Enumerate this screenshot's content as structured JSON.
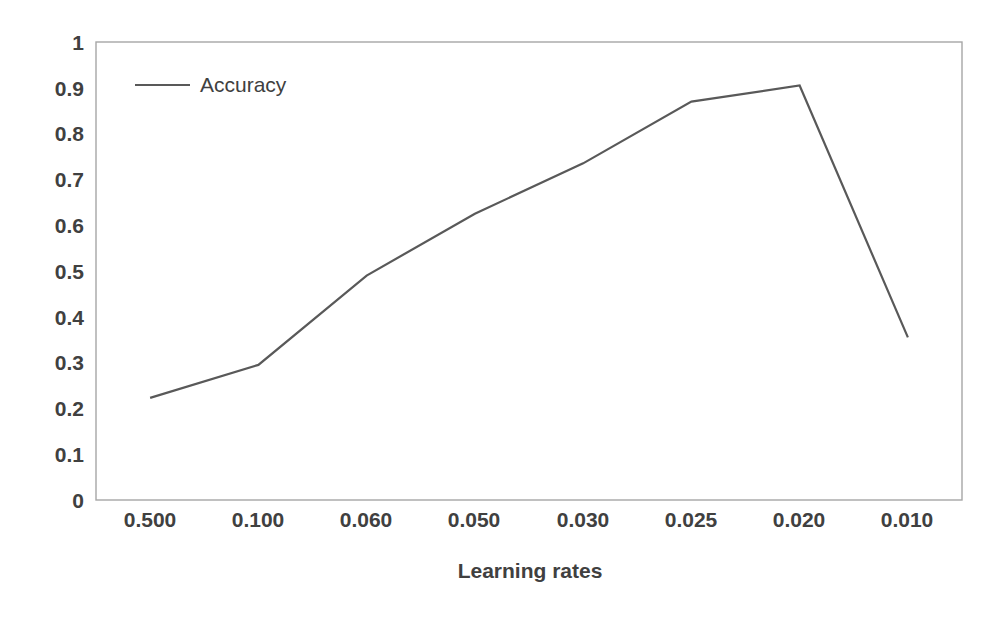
{
  "chart_data": {
    "type": "line",
    "title": "",
    "xlabel": "Learning rates",
    "ylabel": "",
    "categories": [
      "0.500",
      "0.100",
      "0.060",
      "0.050",
      "0.030",
      "0.025",
      "0.020",
      "0.010"
    ],
    "series": [
      {
        "name": "Accuracy",
        "color": "#595959",
        "values": [
          0.223,
          0.295,
          0.49,
          0.625,
          0.735,
          0.87,
          0.905,
          0.355
        ]
      }
    ],
    "ylim": [
      0,
      1
    ],
    "ytick_values": [
      0,
      0.1,
      0.2,
      0.3,
      0.4,
      0.5,
      0.6,
      0.7,
      0.8,
      0.9,
      1
    ],
    "ytick_labels": [
      "0",
      "0.1",
      "0.2",
      "0.3",
      "0.4",
      "0.5",
      "0.6",
      "0.7",
      "0.8",
      "0.9",
      "1"
    ],
    "grid": false,
    "legend_position": "top-left",
    "legend_entries": [
      "Accuracy"
    ],
    "plot_border_color": "#a6a6a6",
    "background_color": "#ffffff"
  },
  "axis": {
    "x_title": "Learning rates"
  },
  "legend": {
    "entry_0_label": "Accuracy"
  },
  "ytick": {
    "t0": "1",
    "t1": "0.9",
    "t2": "0.8",
    "t3": "0.7",
    "t4": "0.6",
    "t5": "0.5",
    "t6": "0.4",
    "t7": "0.3",
    "t8": "0.2",
    "t9": "0.1",
    "t10": "0"
  },
  "xtick": {
    "t0": "0.500",
    "t1": "0.100",
    "t2": "0.060",
    "t3": "0.050",
    "t4": "0.030",
    "t5": "0.025",
    "t6": "0.020",
    "t7": "0.010"
  }
}
